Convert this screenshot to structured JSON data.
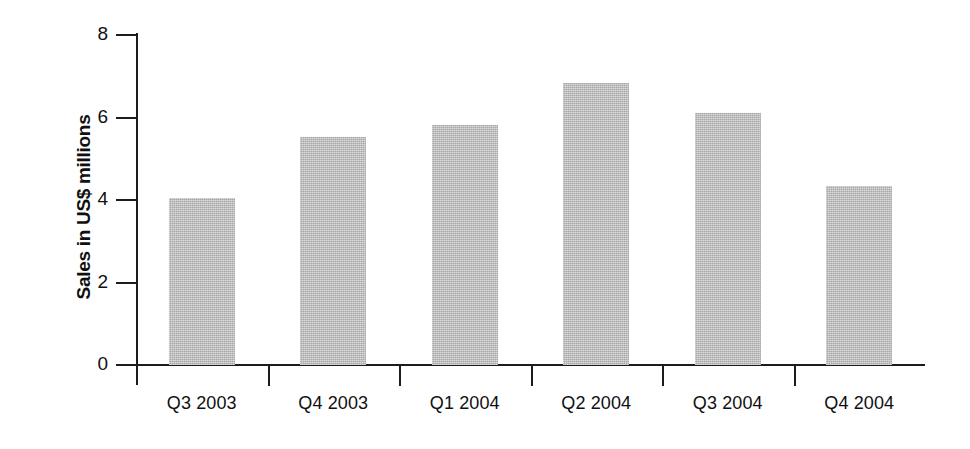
{
  "chart_data": {
    "type": "bar",
    "title": "",
    "xlabel": "",
    "ylabel": "Sales in US$ millions",
    "categories": [
      "Q3 2003",
      "Q4 2003",
      "Q1 2004",
      "Q2 2004",
      "Q3 2004",
      "Q4 2004"
    ],
    "values": [
      4.05,
      5.53,
      5.83,
      6.84,
      6.1,
      4.35
    ],
    "series": [
      {
        "name": "Sales",
        "values": [
          4.05,
          5.53,
          5.83,
          6.84,
          6.1,
          4.35
        ]
      }
    ],
    "ylim": [
      0,
      8
    ],
    "ytick_labels": [
      "0",
      "2",
      "4",
      "6",
      "8"
    ],
    "ytick_values": [
      0,
      2,
      4,
      6,
      8
    ],
    "grid": false,
    "legend": false,
    "legend_position": "none",
    "bar_color": "#b8b8b8",
    "axis_color": "#1c1c1c",
    "background_color": "#ffffff",
    "units": "US$ millions"
  }
}
